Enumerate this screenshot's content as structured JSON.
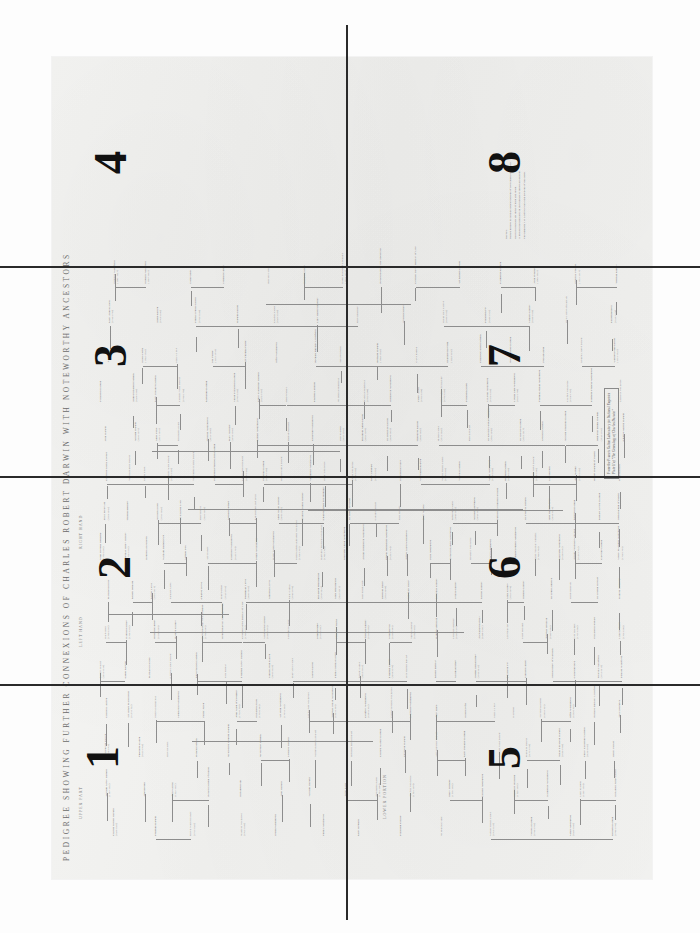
{
  "document": {
    "kind": "scanned-pedigree-chart",
    "title": "PEDIGREE SHOWING FURTHER CONNEXIONS OF CHARLES ROBERT DARWIN WITH NOTEWORTHY ANCESTORS",
    "orientation": "landscape sheet scanned in portrait; chart rotated 90 degrees",
    "paper_color": "#f2f2f0",
    "ink_color": "#6e6e6e",
    "fold_line_color": "#2a2a2a"
  },
  "column_captions": [
    {
      "label": "UPPER PART"
    },
    {
      "label": "LOWER PORTION"
    },
    {
      "label": "LEFT HAND"
    },
    {
      "label": "RIGHT HAND"
    }
  ],
  "section_numbers": [
    {
      "label": "1",
      "quadrant": "top-left"
    },
    {
      "label": "2",
      "quadrant": "upper-middle-left"
    },
    {
      "label": "3",
      "quadrant": "lower-middle-left"
    },
    {
      "label": "4",
      "quadrant": "bottom-left"
    },
    {
      "label": "5",
      "quadrant": "top-right"
    },
    {
      "label": "6",
      "quadrant": "upper-middle-right"
    },
    {
      "label": "7",
      "quadrant": "lower-middle-right"
    },
    {
      "label": "8",
      "quadrant": "bottom-right"
    }
  ],
  "caption_box": {
    "line1": "From the Francis Galton Laboratory for National Eugenics",
    "line2": "Plate II of \"The Genealogy of Charles Darwin\""
  },
  "notes": [
    "NOTES.",
    "Names printed in capitals denote persons of recognised distinction.",
    "Dates in brackets are those of birth and death.",
    "A broken line indicates an illegitimate or uncertain descent.",
    "The numbers 1 to 8 refer to the eight sections of this sheet."
  ],
  "names": [
    "Charles Robert Darwin",
    "Erasmus Darwin",
    "Robert Waring Darwin",
    "Susannah Wedgwood",
    "Josiah Wedgwood",
    "Emma Wedgwood",
    "Mary Howard",
    "Elizabeth Collier",
    "Sir Francis Galton",
    "Samuel Tertius Galton",
    "Violetta Darwin",
    "Sarah Wedgwood",
    "Richard Darwin",
    "William Alvey Darwin",
    "Jane Brown",
    "Ann Waring",
    "Robert Darwin of Elston",
    "Elizabeth Hill",
    "John Darwin",
    "William Darwin",
    "Anne Earle",
    "Sir Erasmus Earle",
    "Thomas Wedgwood",
    "Mary Stringer",
    "Gilbert Wedgwood",
    "Margaret Burslem",
    "Katherine Wedgwood",
    "Lucy Galton",
    "Elizabeth Anne Galton",
    "Sir Douglas Galton",
    "Theodore Galton",
    "Hubert Galton",
    "Francis Darwin",
    "Sir George Howard Darwin",
    "Sir Horace Darwin",
    "Leonard Darwin",
    "William Erasmus Darwin",
    "Henrietta Emma Darwin",
    "Charles Waring Darwin",
    "Elizabeth Darwin",
    "Anne Elizabeth Darwin",
    "Mary Eleanor Darwin",
    "Caroline Sarah Darwin",
    "Marianne Darwin",
    "Susan Elizabeth Darwin",
    "Emily Catherine Darwin",
    "Henry Parker",
    "Charles Langton",
    "Sir James Mackintosh",
    "Frances Mackintosh",
    "Hensleigh Wedgwood",
    "Fanny Allen",
    "John Allen of Cresselly",
    "Elizabeth Allen",
    "Sir John Wedgwood",
    "Louisa Jane Wedgwood",
    "Thomas Josiah Wedgwood",
    "Godfrey Wedgwood",
    "Clement Francis Wedgwood",
    "Laurence Wedgwood",
    "Amy Ruck",
    "Ellen Crofts",
    "Maud du Puy",
    "Ida Farrer",
    "Sir Thomas Farrer",
    "Effie Wedgwood",
    "Richard Buckley Litchfield",
    "Sara Sedgwick",
    "Bernard Darwin",
    "Gwen Raverat",
    "Margaret Keynes",
    "Charles Galton Darwin",
    "Ruth Frances Darwin",
    "Nora Barlow",
    "Erasmus Alvey Darwin",
    "Samuel John Galton",
    "Mary Anne Galton",
    "Adele Galton",
    "Emma Sophia Galton",
    "Darwin Galton",
    "Erasmus Galton",
    "Lucy Harriot Barclay",
    "Robert Barclay",
    "Agatha Gurney",
    "Joseph John Gurney",
    "Elizabeth Fry",
    "Samuel Gurney",
    "John Gurney of Earlham",
    "Catherine Bell",
    "Priscilla Wakefield",
    "Edward Wakefield",
    "Daniel Bell",
    "Hannah Gurney",
    "Richard Gurney",
    "Bartlett Gurney",
    "David Barclay of Cheapside",
    "Robert Barclay the Apologist",
    "Colonel David Barclay of Urie",
    "Sir Robert Gordon",
    "Catherine Gordon",
    "John Freame",
    "Priscilla Freame",
    "Thomas Gurney",
    "John Bevan",
    "Silvanus Bevan",
    "Hannah Springall",
    "Christiana Barclay",
    "Alexander Barclay",
    "Lucy Barclay",
    "Mary Hodgkin",
    "Thomas Hodgkin",
    "John Hodgkin",
    "Elizabeth Howard",
    "Luke Howard",
    "Mariabella Eliot",
    "Robert Howard",
    "Rachel Lloyd",
    "Sampson Lloyd",
    "Charles Lloyd",
    "Mary Farmer",
    "Nehemiah Lloyd",
    "Ambrose Lloyd",
    "Sarah Carless",
    "Elizabeth Braithwaite",
    "Anna Braithwaite",
    "Isaac Braithwaite",
    "Deborah Darby",
    "Abraham Darby",
    "Richenda Gurney",
    "Louisa Gurney",
    "Rachel Gurney",
    "Anna Gurney",
    "Hudson Gurney",
    "Sir John Lubbock",
    "Harriet Hotham",
    "Sir Joseph Hooker",
    "Frances Henslow",
    "John Stevens Henslow",
    "Thomas Henry Huxley",
    "Henrietta Heathorn",
    "William Darwin Fox",
    "Samuel Fox",
    "Ann Darwin",
    "Charlotte Wedgwood",
    "Jessie Wedgwood",
    "Harry Allen Wedgwood",
    "Frances Emma Elizabeth Wedgwood",
    "Katherine Euphemia Wedgwood",
    "Margaret Susan Wedgwood",
    "Arthur Hensleigh Wedgwood",
    "Ernest Hensleigh Wedgwood",
    "Alfred Allen Wedgwood",
    "Julia Wedgwood",
    "Hope Elizabeth Wedgwood",
    "Rowland Wedgwood",
    "Cecil Wedgwood",
    "Josiah Clement Wedgwood",
    "Ralph Vaughan Williams",
    "Margaret Wedgwood",
    "Arthur Vaughan Williams",
    "Caroline Darwin",
    "Sophy Marianne Wedgwood",
    "Eliza Meteyard",
    "Thomas Bentley",
    "William Allen",
    "Sir Charles Lyell",
    "Mary Horner",
    "Leonard Horner",
    "Katharine Murray Lyell",
    "Anne Susan Horner",
    "Frances Joanna Horner",
    "Charles James Fox Bunbury",
    "Sir Henry Holland",
    "Caroline Holland",
    "Peter Holland",
    "Mary Willets",
    "Elizabeth Gaskell",
    "William Stevenson",
    "Swinton Colthurst Holland",
    "Sir Francis Darwin",
    "Jane Harriett Ryle",
    "Reginald Darwin",
    "Edward Levett Darwin",
    "John Darwin of Elston",
    "Charlotte Maria Cooper",
    "Violetta Harriot Darwin",
    "Emma Nixon",
    "Millicent Adele Darwin",
    "Sacheverel Charles Darwin",
    "Elizabeth Frances Ann Darwin"
  ],
  "dates": [
    "(1809-1882)",
    "(1731-1802)",
    "(1766-1848)",
    "(1765-1817)",
    "(1730-1795)",
    "(1808-1896)",
    "(1740-1770)",
    "(1747-1832)",
    "(1822-1911)",
    "(1783-1844)",
    "(1783-1874)",
    "(1776-1856)",
    "(1726-1816)",
    "(1681-1754)",
    "(1724-1765)",
    "(1702-1760)",
    "(1672-1754)",
    "(1700-1780)",
    "(1620-1692)",
    "(1655-1722)",
    "(1730-1799)",
    "(1769-1843)",
    "(1795-1880)",
    "(1803-1889)",
    "(1845-1912)",
    "(1848-1925)",
    "(1850-1928)",
    "(1839-1914)",
    "(1841-1927)",
    "(1887-1962)",
    "(1894-1979)",
    "(1748-1832)",
    "(1753-1817)",
    "(1780-1866)",
    "(1788-1856)",
    "(1810-1889)",
    "(1778-1845)",
    "(1796-1873)",
    "(1805-1873)",
    "(1815-1891)",
    "(1833-1898)",
    "(1859-1943)",
    "(1872-1958)",
    "(1885-1974)",
    "(1804-1881)"
  ]
}
